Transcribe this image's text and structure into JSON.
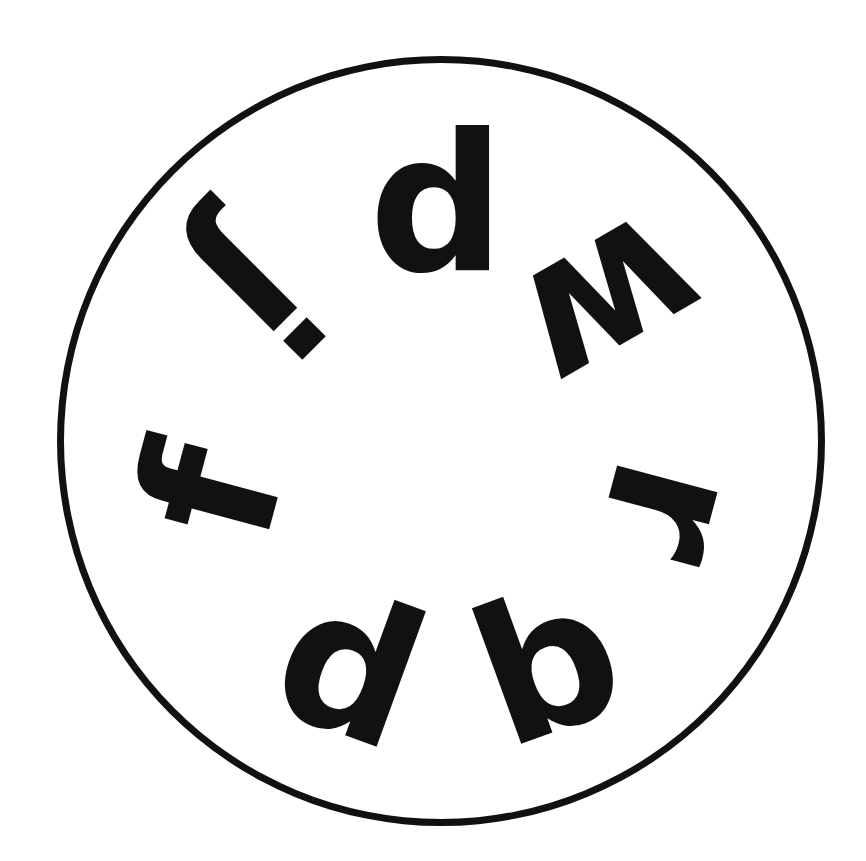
{
  "figure": {
    "background": "#ffffff",
    "ink_color": "#111111",
    "circle": {
      "center_x": 437,
      "center_y": 437,
      "radius": 380,
      "stroke_width": 7
    },
    "letters": [
      {
        "char": "d",
        "x": 437,
        "y": 205,
        "rotation_deg": 0
      },
      {
        "char": "w",
        "x": 612,
        "y": 305,
        "rotation_deg": 150
      },
      {
        "char": "r",
        "x": 672,
        "y": 512,
        "rotation_deg": 105
      },
      {
        "char": "b",
        "x": 548,
        "y": 665,
        "rotation_deg": -20
      },
      {
        "char": "d",
        "x": 350,
        "y": 668,
        "rotation_deg": 20
      },
      {
        "char": "f",
        "x": 212,
        "y": 492,
        "rotation_deg": -75
      },
      {
        "char": "j",
        "x": 258,
        "y": 292,
        "rotation_deg": 135
      }
    ]
  }
}
